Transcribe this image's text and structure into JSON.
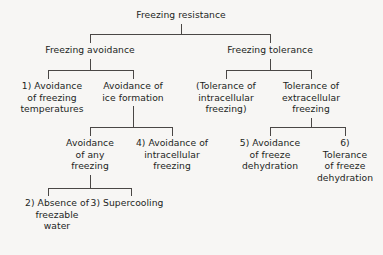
{
  "diagram": {
    "type": "hierarchy-tree",
    "background_color": "#f7f6f4",
    "line_color": "#4a4745",
    "text_color": "#231f1d",
    "nodes": {
      "root": {
        "label": "Freezing resistance",
        "level": 1,
        "x": 181,
        "y": 16
      },
      "freezing_avoidance": {
        "label": "Freezing avoidance",
        "level": 2,
        "x": 90,
        "y": 51
      },
      "freezing_tolerance": {
        "label": "Freezing tolerance",
        "level": 2,
        "x": 270,
        "y": 51
      },
      "avoidance_of_freezing_temperatures": {
        "label": "1)  Avoidance\nof freezing\ntemperatures",
        "number": "1)",
        "level": 3,
        "x": 52,
        "y": 86
      },
      "avoidance_of_ice_formation": {
        "label": "Avoidance of\nice formation",
        "level": 3,
        "x": 133,
        "y": 86
      },
      "tolerance_of_intracellular_freezing": {
        "label": "(Tolerance of\nintracellular\nfreezing)",
        "level": 3,
        "x": 226,
        "y": 86
      },
      "tolerance_of_extracellular_freezing": {
        "label": "Tolerance of\nextracellular\nfreezing",
        "level": 3,
        "x": 311,
        "y": 86
      },
      "avoidance_of_any_freezing": {
        "label": "Avoidance\nof any\nfreezing",
        "level": 4,
        "x": 90,
        "y": 143
      },
      "avoidance_of_intracellular_freezing": {
        "label": "4)  Avoidance of\nintracellular\nfreezing",
        "number": "4)",
        "level": 4,
        "x": 172,
        "y": 143
      },
      "avoidance_of_freeze_dehydration": {
        "label": "5)  Avoidance\nof freeze\ndehydration",
        "number": "5)",
        "level": 4,
        "x": 270,
        "y": 143
      },
      "tolerance_of_freeze_dehydration": {
        "label": "6)  Tolerance\nof freeze\ndehydration",
        "number": "6)",
        "level": 4,
        "x": 345,
        "y": 143
      },
      "absence_of_freezable_water": {
        "label": "2)  Absence of\nfreezable\nwater",
        "number": "2)",
        "level": 5,
        "x": 57,
        "y": 203
      },
      "supercooling": {
        "label": "3)  Supercooling",
        "number": "3)",
        "level": 5,
        "x": 127,
        "y": 203
      }
    },
    "connectors": [
      {
        "name": "root-stem",
        "from": "root",
        "to": "split-1"
      },
      {
        "name": "split-1-bar",
        "children": [
          "freezing_avoidance",
          "freezing_tolerance"
        ]
      },
      {
        "name": "freezing-avoidance-stem",
        "from": "freezing_avoidance",
        "to": "split-2a"
      },
      {
        "name": "split-2a-bar",
        "children": [
          "avoidance_of_freezing_temperatures",
          "avoidance_of_ice_formation"
        ]
      },
      {
        "name": "freezing-tolerance-stem",
        "from": "freezing_tolerance",
        "to": "split-2b"
      },
      {
        "name": "split-2b-bar",
        "children": [
          "tolerance_of_intracellular_freezing",
          "tolerance_of_extracellular_freezing"
        ]
      },
      {
        "name": "ice-formation-stem",
        "from": "avoidance_of_ice_formation",
        "to": "split-3a"
      },
      {
        "name": "split-3a-bar",
        "children": [
          "avoidance_of_any_freezing",
          "avoidance_of_intracellular_freezing"
        ]
      },
      {
        "name": "extracellular-freezing-stem",
        "from": "tolerance_of_extracellular_freezing",
        "to": "split-3b"
      },
      {
        "name": "split-3b-bar",
        "children": [
          "avoidance_of_freeze_dehydration",
          "tolerance_of_freeze_dehydration"
        ]
      },
      {
        "name": "any-freezing-stem",
        "from": "avoidance_of_any_freezing",
        "to": "split-4a"
      },
      {
        "name": "split-4a-bar",
        "children": [
          "absence_of_freezable_water",
          "supercooling"
        ]
      }
    ]
  }
}
